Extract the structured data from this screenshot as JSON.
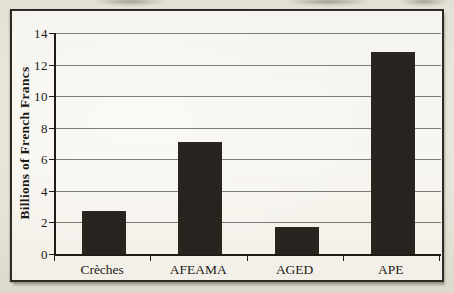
{
  "chart_data": {
    "type": "bar",
    "title": "",
    "categories": [
      "Crèches",
      "AFEAMA",
      "AGED",
      "APE"
    ],
    "values": [
      2.7,
      7.1,
      1.7,
      12.8
    ],
    "xlabel": "",
    "ylabel": "Billions of French Francs",
    "ylim": [
      0,
      14
    ],
    "ytick_step": 2,
    "grid": true,
    "legend": "none",
    "bar_color": "#282320",
    "gridline_color": "#7e7c77",
    "plot_background": "#f7f5ef",
    "frame_border_color": "#2e2b26"
  }
}
